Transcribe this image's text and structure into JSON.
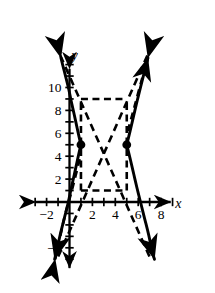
{
  "chart_data": {
    "type": "line",
    "title": "",
    "xlabel": "x",
    "ylabel": "y",
    "grid": false,
    "legend": "none",
    "xlim": [
      -3.2,
      9.8
    ],
    "ylim": [
      -5.6,
      12.6
    ],
    "x_ticks": [
      -3,
      -2,
      -1,
      0,
      1,
      2,
      3,
      4,
      5,
      6,
      7,
      8,
      9
    ],
    "y_ticks": [
      -5,
      -4,
      -3,
      -2,
      -1,
      0,
      1,
      2,
      3,
      4,
      5,
      6,
      7,
      8,
      9,
      10,
      11,
      12
    ],
    "x_tick_labels": [
      {
        "value": -2,
        "text": "−2"
      },
      {
        "value": 2,
        "text": "2"
      },
      {
        "value": 4,
        "text": "4"
      },
      {
        "value": 6,
        "text": "6"
      },
      {
        "value": 8,
        "text": "8"
      }
    ],
    "y_tick_labels": [
      {
        "value": -4,
        "text": "−4"
      },
      {
        "value": 2,
        "text": "2"
      },
      {
        "value": 4,
        "text": "4"
      },
      {
        "value": 6,
        "text": "6"
      },
      {
        "value": 8,
        "text": "8"
      },
      {
        "value": 10,
        "text": "10"
      }
    ],
    "center": {
      "x": 3,
      "y": 5
    },
    "vertices": [
      {
        "x": 1,
        "y": 5,
        "marker": "filled-dot"
      },
      {
        "x": 5,
        "y": 5,
        "marker": "filled-dot"
      }
    ],
    "asymptote_box": {
      "x_min": 1,
      "x_max": 5,
      "y_min": 1,
      "y_max": 9
    },
    "asymptotes": [
      {
        "from": {
          "x": -0.8,
          "y": 12.8
        },
        "to": {
          "x": 7.0,
          "y": -4.8
        },
        "style": "dashed"
      },
      {
        "from": {
          "x": 6.8,
          "y": 12.8
        },
        "to": {
          "x": -1.0,
          "y": -4.8
        },
        "style": "dashed"
      }
    ],
    "series": [
      {
        "name": "left-branch",
        "style": "solid",
        "arrow_ends": "both",
        "points": [
          {
            "x": -0.75,
            "y": 12.6
          },
          {
            "x": -0.45,
            "y": 11.4
          },
          {
            "x": -0.1,
            "y": 10.0
          },
          {
            "x": 0.15,
            "y": 8.8
          },
          {
            "x": 0.42,
            "y": 7.6
          },
          {
            "x": 0.68,
            "y": 6.4
          },
          {
            "x": 0.9,
            "y": 5.4
          },
          {
            "x": 1.0,
            "y": 5.0
          },
          {
            "x": 0.9,
            "y": 4.6
          },
          {
            "x": 0.68,
            "y": 3.6
          },
          {
            "x": 0.42,
            "y": 2.4
          },
          {
            "x": 0.15,
            "y": 1.2
          },
          {
            "x": -0.1,
            "y": 0.0
          },
          {
            "x": -0.45,
            "y": -1.4
          },
          {
            "x": -0.8,
            "y": -2.8
          },
          {
            "x": -1.15,
            "y": -4.4
          },
          {
            "x": -1.3,
            "y": -5.0
          }
        ]
      },
      {
        "name": "right-branch",
        "style": "solid",
        "arrow_ends": "both",
        "points": [
          {
            "x": 6.85,
            "y": 12.6
          },
          {
            "x": 6.55,
            "y": 11.4
          },
          {
            "x": 6.2,
            "y": 10.0
          },
          {
            "x": 5.9,
            "y": 8.8
          },
          {
            "x": 5.62,
            "y": 7.6
          },
          {
            "x": 5.34,
            "y": 6.4
          },
          {
            "x": 5.1,
            "y": 5.4
          },
          {
            "x": 5.0,
            "y": 5.0
          },
          {
            "x": 5.1,
            "y": 4.6
          },
          {
            "x": 5.34,
            "y": 3.6
          },
          {
            "x": 5.62,
            "y": 2.4
          },
          {
            "x": 5.9,
            "y": 1.2
          },
          {
            "x": 6.2,
            "y": 0.0
          },
          {
            "x": 6.55,
            "y": -1.4
          },
          {
            "x": 6.9,
            "y": -2.8
          },
          {
            "x": 7.25,
            "y": -4.4
          },
          {
            "x": 7.42,
            "y": -5.0
          }
        ]
      }
    ],
    "dashed_branches": [
      {
        "name": "left-dashed-arrow",
        "style": "dashed",
        "points": [
          {
            "x": -1.25,
            "y": -5.0
          },
          {
            "x": -0.45,
            "y": -1.4
          },
          {
            "x": 0.25,
            "y": 1.2
          },
          {
            "x": 0.95,
            "y": 4.0
          }
        ]
      },
      {
        "name": "right-dashed-arrow",
        "style": "dashed",
        "points": [
          {
            "x": 5.1,
            "y": 6.2
          },
          {
            "x": 5.7,
            "y": 8.4
          },
          {
            "x": 6.35,
            "y": 10.8
          },
          {
            "x": 6.85,
            "y": 12.6
          }
        ]
      }
    ],
    "annotations": [
      {
        "text": "x",
        "x": 9.5,
        "y": -0.55,
        "role": "x-axis-label",
        "italic": true
      },
      {
        "text": "y",
        "x": 0.45,
        "y": 12.4,
        "role": "y-axis-label",
        "italic": true
      }
    ],
    "colors": {
      "axis": "#000000",
      "curve": "#000000",
      "asymptote": "#000000",
      "marker": "#000000",
      "background": "#ffffff"
    }
  }
}
